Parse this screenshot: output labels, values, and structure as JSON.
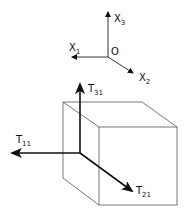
{
  "axes": {
    "origin_label": "O",
    "x1": {
      "base": "X",
      "sub": "1"
    },
    "x2": {
      "base": "X",
      "sub": "2"
    },
    "x3": {
      "base": "X",
      "sub": "3"
    }
  },
  "vectors": {
    "t11": {
      "base": "T",
      "sub": "11"
    },
    "t21": {
      "base": "T",
      "sub": "21"
    },
    "t31": {
      "base": "T",
      "sub": "31"
    }
  },
  "colors": {
    "line": "#111111",
    "cube": "#555555",
    "background": "#ffffff"
  }
}
